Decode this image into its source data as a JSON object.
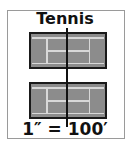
{
  "title": "Tennis",
  "scale_label": "1″ = 100′",
  "colors": {
    "court_fill": "#8c8c8c",
    "court_lines": "#d8d8d8",
    "border": "#1a1a1a",
    "frame": "#9a9a9a"
  },
  "courts": [
    {
      "name": "court-top"
    },
    {
      "name": "court-bottom"
    }
  ]
}
